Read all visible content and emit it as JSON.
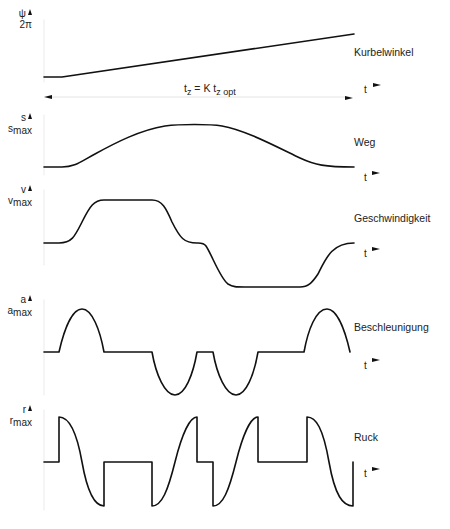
{
  "diagram": {
    "type": "motion-law timing diagram",
    "panels": [
      {
        "id": "crank-angle",
        "y_symbol": "ψ",
        "y_max_label": "2π",
        "curve_label": "Kurbelwinkel",
        "x_label": "t",
        "shape": "linear ramp"
      },
      {
        "id": "displacement",
        "y_symbol": "s",
        "y_max_label": "s",
        "y_max_sub": "max",
        "curve_label": "Weg",
        "x_label": "t",
        "shape": "smooth rise-dwell-return"
      },
      {
        "id": "velocity",
        "y_symbol": "v",
        "y_max_label": "v",
        "y_max_sub": "max",
        "curve_label": "Geschwindigkeit",
        "x_label": "t",
        "shape": "trapezoid positive then negative"
      },
      {
        "id": "acceleration",
        "y_symbol": "a",
        "y_max_label": "a",
        "y_max_sub": "max",
        "curve_label": "Beschleunigung",
        "x_label": "t",
        "shape": "sine half-waves with dwell"
      },
      {
        "id": "jerk",
        "y_symbol": "r",
        "y_max_label": "r",
        "y_max_sub": "max",
        "curve_label": "Ruck",
        "x_label": "t",
        "shape": "sine-shaped with jumps"
      }
    ],
    "period_annotation": {
      "text_prefix": "t",
      "text_sub1": "z",
      "text_mid": " = K t",
      "text_sub2": "z opt"
    },
    "stroke_color": "#111111",
    "background": "#ffffff"
  }
}
